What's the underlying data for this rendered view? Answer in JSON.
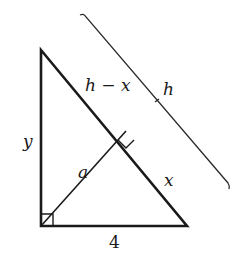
{
  "diagram": {
    "type": "right-triangle-with-altitude",
    "labels": {
      "hypotenuse_upper": "h − x",
      "hypotenuse_total": "h",
      "left_leg": "y",
      "altitude": "a",
      "hypotenuse_lower": "x",
      "base": "4"
    },
    "vertices": {
      "top": [
        41,
        50
      ],
      "bottom_left": [
        41,
        226
      ],
      "bottom_right": [
        187,
        226
      ],
      "altitude_foot": [
        126,
        131
      ]
    },
    "colors": {
      "stroke": "#1a1a1a",
      "background": "#ffffff"
    }
  }
}
